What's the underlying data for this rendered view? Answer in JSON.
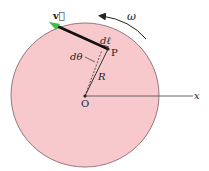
{
  "diagram": {
    "labels": {
      "velocity": "v⃗",
      "omega": "ω",
      "dl": "dℓ",
      "point_p": "P",
      "dtheta": "dθ",
      "radius": "R",
      "origin": "O",
      "x_axis": "x"
    },
    "colors": {
      "disk_fill": "#f7c9cc",
      "disk_stroke": "#8a6a6e",
      "velocity_vector": "#111111",
      "velocity_arrowhead": "#3fbf3f",
      "axis": "#555555",
      "text": "#222222"
    },
    "geometry": {
      "center": [
        85,
        96
      ],
      "radius": 73,
      "point_p": [
        108,
        49
      ],
      "velocity_tip": [
        50,
        23
      ],
      "x_axis_end": [
        196,
        96
      ]
    }
  }
}
